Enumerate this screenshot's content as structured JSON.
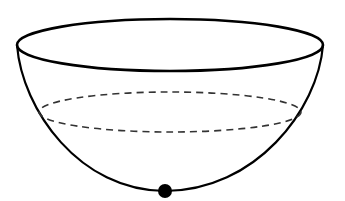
{
  "diagram": {
    "colors": {
      "stroke": "#000000",
      "background": "#ffffff",
      "ball": "#000000"
    },
    "rim": {
      "cx": 170,
      "cy": 45,
      "rx": 153,
      "ry": 26
    },
    "inner_level": {
      "cx": 170,
      "cy": 112,
      "rx": 131,
      "ry": 20,
      "style": "dashed"
    },
    "bowl_bottom_y": 191,
    "ball": {
      "cx": 165,
      "cy": 191,
      "r": 7
    }
  }
}
